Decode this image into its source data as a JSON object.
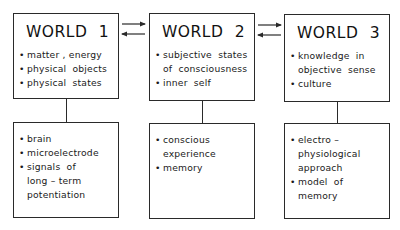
{
  "diagram": {
    "worlds": [
      {
        "title": "WORLD  1",
        "items": [
          {
            "bullet": "•",
            "lines": [
              "matter , energy"
            ]
          },
          {
            "bullet": "•",
            "lines": [
              "physical  objects"
            ]
          },
          {
            "bullet": "•",
            "lines": [
              "physical  states"
            ]
          }
        ],
        "detail": [
          {
            "bullet": "•",
            "lines": [
              "brain"
            ]
          },
          {
            "bullet": "•",
            "lines": [
              "microelectrode"
            ]
          },
          {
            "bullet": "•",
            "lines": [
              "signals  of",
              "long – term",
              "potentiation"
            ]
          }
        ]
      },
      {
        "title": "WORLD  2",
        "items": [
          {
            "bullet": "•",
            "lines": [
              "subjective  states",
              "of  consciousness"
            ]
          },
          {
            "bullet": "•",
            "lines": [
              "inner  self"
            ]
          }
        ],
        "detail": [
          {
            "bullet": "•",
            "lines": [
              "conscious",
              "experience"
            ]
          },
          {
            "bullet": "•",
            "lines": [
              "memory"
            ]
          }
        ]
      },
      {
        "title": "WORLD  3",
        "items": [
          {
            "bullet": "•",
            "lines": [
              "knowledge  in",
              "objective  sense"
            ]
          },
          {
            "bullet": "•",
            "lines": [
              "culture"
            ]
          }
        ],
        "detail": [
          {
            "bullet": "•",
            "lines": [
              "electro –",
              "physiological",
              "approach"
            ]
          },
          {
            "bullet": "•",
            "lines": [
              "model  of",
              "memory"
            ]
          }
        ]
      }
    ],
    "connections": [
      {
        "from": "WORLD 1",
        "to": "WORLD 2",
        "type": "bidirectional"
      },
      {
        "from": "WORLD 2",
        "to": "WORLD 3",
        "type": "bidirectional"
      }
    ],
    "colors": {
      "stroke": "#2a2a2a",
      "text": "#111111",
      "background": "#ffffff"
    }
  }
}
